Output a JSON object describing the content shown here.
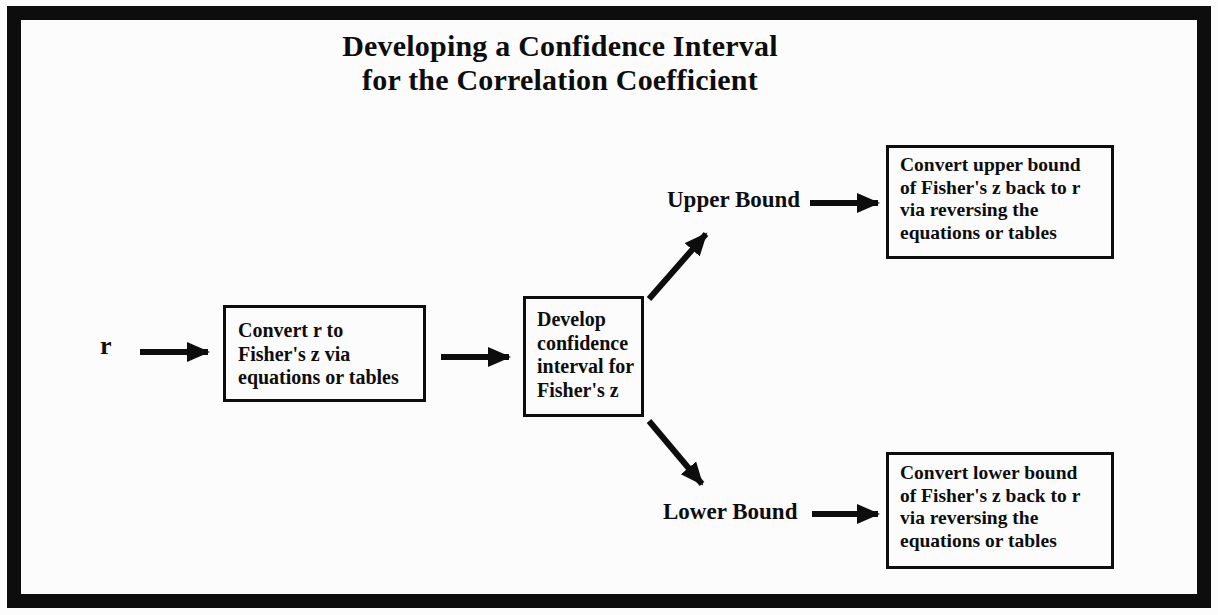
{
  "colors": {
    "ink": "#0d0d0d",
    "background": "#fcfcfc"
  },
  "title": {
    "line1": "Developing a Confidence Interval",
    "line2": "for the Correlation Coefficient"
  },
  "nodes": {
    "start_label": "r",
    "convert_to_z": {
      "lines": [
        "Convert r to",
        "Fisher's z via",
        "equations or tables"
      ]
    },
    "develop_ci": {
      "lines": [
        "Develop",
        "confidence",
        "interval for",
        "Fisher's z"
      ]
    },
    "upper_bound_label": "Upper Bound",
    "lower_bound_label": "Lower Bound",
    "convert_upper": {
      "lines": [
        "Convert upper bound",
        "of Fisher's z back to r",
        "via reversing the",
        "equations or tables"
      ]
    },
    "convert_lower": {
      "lines": [
        "Convert lower bound",
        "of Fisher's z back to r",
        "via reversing the",
        "equations or tables"
      ]
    }
  }
}
